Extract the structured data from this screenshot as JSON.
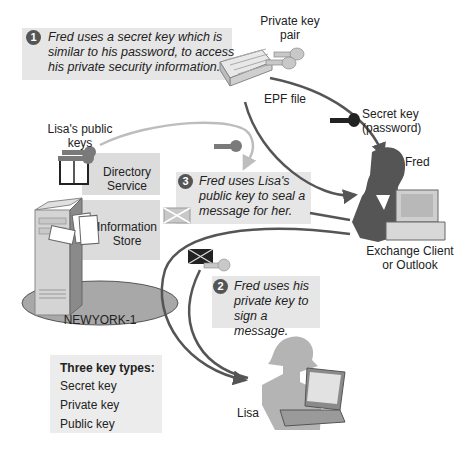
{
  "diagram": {
    "type": "exchange-key-management-flow",
    "steps": [
      {
        "number": "1",
        "text_lines": [
          "Fred uses a secret key which is",
          "similar to his password, to access",
          "his private security information."
        ]
      },
      {
        "number": "2",
        "text_lines": [
          "Fred uses his",
          "private key to",
          "sign a message."
        ]
      },
      {
        "number": "3",
        "text_lines": [
          "Fred uses Lisa's",
          "public key to seal a",
          "message for her."
        ]
      }
    ],
    "labels": {
      "private_key_pair": [
        "Private key",
        "pair"
      ],
      "epf_file": "EPF file",
      "secret_key": [
        "Secret key",
        "(password)"
      ],
      "fred": "Fred",
      "exchange_client": [
        "Exchange Client",
        "or Outlook"
      ],
      "lisas_public_keys": [
        "Lisa's public",
        "keys"
      ],
      "directory_service": [
        "Directory",
        "Service"
      ],
      "information_store": [
        "Information",
        "Store"
      ],
      "server": "NEWYORK-1",
      "lisa": "Lisa"
    },
    "legend": {
      "title": "Three key types:",
      "items": [
        {
          "label": "Secret key",
          "icon": "secret-key-icon",
          "color": "#222222"
        },
        {
          "label": "Private key",
          "icon": "private-key-icon",
          "color": "#c8c8c8"
        },
        {
          "label": "Public key",
          "icon": "public-key-icon",
          "color": "#7a7a7a"
        }
      ]
    },
    "colors": {
      "callout_bg": "#e6e6e6",
      "panel_bg": "#dcdcdc",
      "arrow": "#555555",
      "light_arrow": "#bdbdbd",
      "secret_key": "#222222",
      "private_key": "#c8c8c8",
      "public_key": "#7a7a7a",
      "server_base": "#a8a8a8"
    }
  }
}
